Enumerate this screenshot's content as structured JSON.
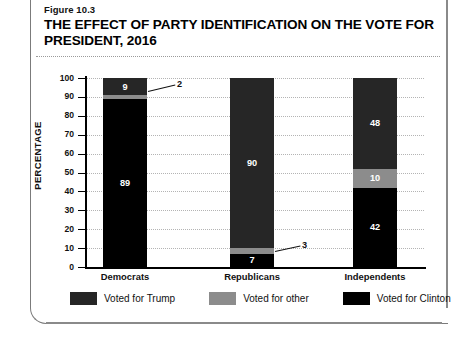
{
  "figure": {
    "number": "Figure 10.3",
    "title": "THE EFFECT OF PARTY IDENTIFICATION ON THE VOTE FOR PRESIDENT, 2016"
  },
  "colors": {
    "trump": "#262626",
    "other": "#8c8c8c",
    "clinton": "#000000",
    "gridline": "#b4b4b4",
    "axis": "#000000",
    "card_border": "#7b7b7b",
    "label_text": "#ffffff"
  },
  "chart_data": {
    "type": "bar",
    "stacked": true,
    "title": "THE EFFECT OF PARTY IDENTIFICATION ON THE VOTE FOR PRESIDENT, 2016",
    "xlabel": "",
    "ylabel": "PERCENTAGE",
    "ylim": [
      0,
      100
    ],
    "yticks": [
      0,
      10,
      20,
      30,
      40,
      50,
      60,
      70,
      80,
      90,
      100
    ],
    "ytick_labels": [
      "0",
      "10",
      "20",
      "30",
      "40",
      "50",
      "60",
      "70",
      "80",
      "90",
      "100"
    ],
    "grid": true,
    "legend_position": "bottom",
    "categories": [
      "Democrats",
      "Republicans",
      "Independents"
    ],
    "series": [
      {
        "name": "Voted for Clinton",
        "values": [
          89,
          7,
          42
        ],
        "color": "#000000"
      },
      {
        "name": "Voted for other",
        "values": [
          2,
          3,
          10
        ],
        "color": "#8c8c8c"
      },
      {
        "name": "Voted for Trump",
        "values": [
          9,
          90,
          48
        ],
        "color": "#262626"
      }
    ],
    "stack_order_bottom_to_top": [
      "Voted for Clinton",
      "Voted for other",
      "Voted for Trump"
    ],
    "bars": [
      {
        "category": "Democrats",
        "segments": [
          {
            "series": "Voted for Trump",
            "value": 9,
            "label": "9",
            "label_inside": true
          },
          {
            "series": "Voted for other",
            "value": 2,
            "label": "2",
            "label_inside": false
          },
          {
            "series": "Voted for Clinton",
            "value": 89,
            "label": "89",
            "label_inside": true
          }
        ]
      },
      {
        "category": "Republicans",
        "segments": [
          {
            "series": "Voted for Trump",
            "value": 90,
            "label": "90",
            "label_inside": true
          },
          {
            "series": "Voted for other",
            "value": 3,
            "label": "3",
            "label_inside": false
          },
          {
            "series": "Voted for Clinton",
            "value": 7,
            "label": "7",
            "label_inside": true
          }
        ]
      },
      {
        "category": "Independents",
        "segments": [
          {
            "series": "Voted for Trump",
            "value": 48,
            "label": "48",
            "label_inside": true
          },
          {
            "series": "Voted for other",
            "value": 10,
            "label": "10",
            "label_inside": true
          },
          {
            "series": "Voted for Clinton",
            "value": 42,
            "label": "42",
            "label_inside": true
          }
        ]
      }
    ],
    "callouts": [
      {
        "label": "2",
        "for_category": "Democrats",
        "for_series": "Voted for other"
      },
      {
        "label": "3",
        "for_category": "Republicans",
        "for_series": "Voted for other"
      }
    ]
  },
  "axis": {
    "y_title": "PERCENTAGE",
    "y_tick_labels": [
      "100",
      "90",
      "80",
      "70",
      "60",
      "50",
      "40",
      "30",
      "20",
      "10",
      "0"
    ],
    "x_labels": [
      "Democrats",
      "Republicans",
      "Independents"
    ]
  },
  "legend": {
    "items": [
      {
        "label": "Voted for Trump",
        "color": "#262626"
      },
      {
        "label": "Voted for other",
        "color": "#8c8c8c"
      },
      {
        "label": "Voted for Clinton",
        "color": "#000000"
      }
    ]
  }
}
